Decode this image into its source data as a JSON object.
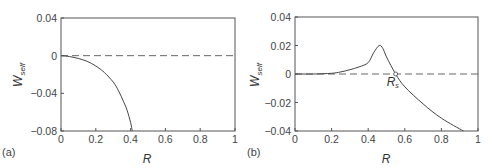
{
  "chart_data": [
    {
      "type": "line",
      "panel_label": "(a)",
      "xlabel": "R",
      "ylabel": "W",
      "ylabel_subscript": "self",
      "xlim": [
        0,
        1
      ],
      "ylim": [
        -0.08,
        0.04
      ],
      "x_ticks": [
        "0",
        "0.2",
        "0.4",
        "0.6",
        "0.8",
        "1"
      ],
      "y_ticks": [
        "0.04",
        "0",
        "-0.04",
        "-0.08"
      ],
      "grid": false,
      "reference_line": {
        "y": 0,
        "style": "dashed"
      },
      "series": [
        {
          "name": "W_self",
          "x": [
            0,
            0.05,
            0.1,
            0.15,
            0.2,
            0.25,
            0.3,
            0.33,
            0.36,
            0.38,
            0.4,
            0.41
          ],
          "y": [
            0,
            -0.001,
            -0.003,
            -0.006,
            -0.011,
            -0.018,
            -0.028,
            -0.037,
            -0.049,
            -0.058,
            -0.071,
            -0.08
          ]
        }
      ]
    },
    {
      "type": "line",
      "panel_label": "(b)",
      "xlabel": "R",
      "ylabel": "W",
      "ylabel_subscript": "self",
      "xlim": [
        0,
        1
      ],
      "ylim": [
        -0.04,
        0.04
      ],
      "x_ticks": [
        "0",
        "0.2",
        "0.4",
        "0.6",
        "0.8",
        "1"
      ],
      "y_ticks": [
        "0.04",
        "0.02",
        "0",
        "-0.02",
        "-0.04"
      ],
      "grid": false,
      "reference_line": {
        "y": 0,
        "style": "dashed"
      },
      "annotation": {
        "text": "R",
        "subscript": "s",
        "x": 0.55,
        "y": 0,
        "marker": "open-circle"
      },
      "series": [
        {
          "name": "W_self",
          "x": [
            0,
            0.1,
            0.2,
            0.25,
            0.3,
            0.35,
            0.4,
            0.43,
            0.46,
            0.48,
            0.5,
            0.55,
            0.6,
            0.7,
            0.8,
            0.92
          ],
          "y": [
            0,
            0,
            0.0005,
            0.0015,
            0.003,
            0.005,
            0.008,
            0.015,
            0.02,
            0.018,
            0.012,
            0,
            -0.009,
            -0.021,
            -0.031,
            -0.04
          ]
        }
      ]
    }
  ]
}
